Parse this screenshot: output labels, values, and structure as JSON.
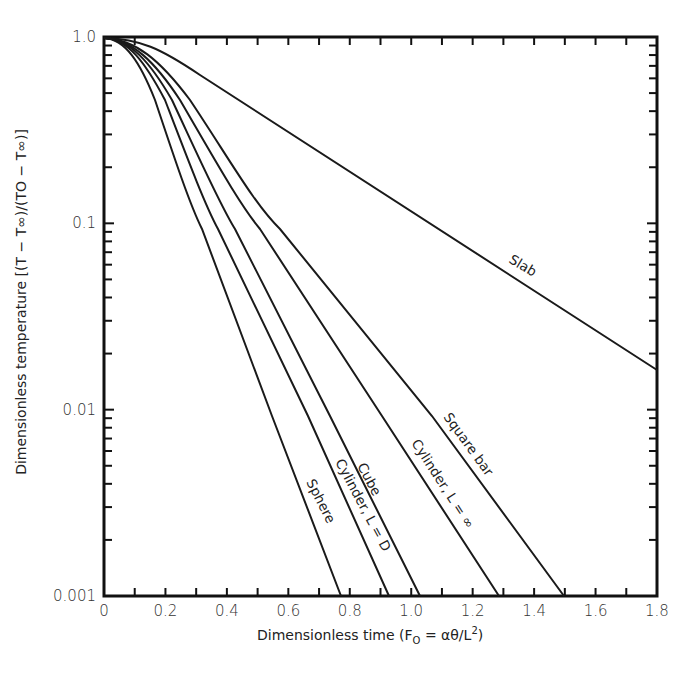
{
  "chart_data": {
    "type": "line",
    "title": "",
    "xlabel": "Dimensionless time (F_O = αθ/L²)",
    "ylabel": "Dimensionless temperature [(T − T∞)/(T_O − T∞)]",
    "xlim": [
      0,
      1.8
    ],
    "ylim": [
      0.001,
      1.0
    ],
    "yscale": "log",
    "grid": false,
    "legend": "inline labels on curves",
    "x_ticks": [
      "0",
      "0.2",
      "0.4",
      "0.6",
      "0.8",
      "1.0",
      "1.2",
      "1.4",
      "1.6",
      "1.8"
    ],
    "y_ticks": [
      "1.0",
      "0.1",
      "0.01",
      "0.001"
    ],
    "series": [
      {
        "name": "Sphere",
        "x": [
          0,
          0.05,
          0.1,
          0.16,
          0.32,
          0.55,
          0.77
        ],
        "y": [
          1.0,
          0.97,
          0.75,
          0.3,
          0.1,
          0.01,
          0.001
        ]
      },
      {
        "name": "Cylinder, L = D",
        "x": [
          0,
          0.06,
          0.12,
          0.2,
          0.37,
          0.67,
          0.93
        ],
        "y": [
          1.0,
          0.97,
          0.75,
          0.3,
          0.1,
          0.01,
          0.001
        ]
      },
      {
        "name": "Cube",
        "x": [
          0,
          0.07,
          0.14,
          0.22,
          0.43,
          0.74,
          1.03
        ],
        "y": [
          1.0,
          0.97,
          0.75,
          0.3,
          0.1,
          0.01,
          0.001
        ]
      },
      {
        "name": "Cylinder, L = ∞",
        "x": [
          0,
          0.08,
          0.16,
          0.25,
          0.51,
          0.91,
          1.29
        ],
        "y": [
          1.0,
          0.97,
          0.75,
          0.3,
          0.1,
          0.01,
          0.001
        ]
      },
      {
        "name": "Square bar",
        "x": [
          0,
          0.09,
          0.19,
          0.29,
          0.57,
          1.07,
          1.5
        ],
        "y": [
          1.0,
          0.97,
          0.75,
          0.3,
          0.1,
          0.01,
          0.001
        ]
      },
      {
        "name": "Slab",
        "x": [
          0,
          0.1,
          0.3,
          0.6,
          0.9,
          1.2,
          1.5,
          1.8
        ],
        "y": [
          1.0,
          0.98,
          0.72,
          0.35,
          0.17,
          0.085,
          0.04,
          0.017
        ]
      }
    ]
  },
  "labels": {
    "xlabel": "Dimensionless time (F",
    "xlabel_sub": "O",
    "xlabel_rest": " = αθ/L",
    "xlabel_sup": "2",
    "xlabel_close": ")",
    "ylabel": "Dimensionless temperature  [(T − T∞)/(TO − T∞)]",
    "curves": {
      "sphere": "Sphere",
      "cyl_d": "Cylinder, L = D",
      "cube": "Cube",
      "cyl_inf": "Cylinder, L = ∞",
      "square": "Square bar",
      "slab": "Slab"
    },
    "x_ticks": [
      "0",
      "0.2",
      "0.4",
      "0.6",
      "0.8",
      "1.0",
      "1.2",
      "1.4",
      "1.6",
      "1.8"
    ],
    "y_ticks": [
      "1.0",
      "0.1",
      "0.01",
      "0.001"
    ]
  }
}
